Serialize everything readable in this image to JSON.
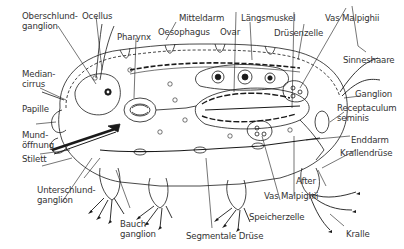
{
  "diagram": {
    "language": "German",
    "colors": {
      "line": "#1a1a1a",
      "text": "#333333",
      "background": "#ffffff"
    },
    "labels": {
      "oberschlundganglion": "Oberschlund-\nganglion",
      "ocellus": "Ocellus",
      "pharynx": "Pharynx",
      "oesophagus": "Oesophagus",
      "mitteldarm": "Mitteldarm",
      "ovar": "Ovar",
      "laengsmuskel": "Längsmuskel",
      "druesenzelle": "Drüsenzelle",
      "vas_malpighii_top": "Vas Malpighii",
      "sinneshaare": "Sinneshaare",
      "mediancirrus": "Median-\ncirrus",
      "ganglion": "Ganglion",
      "papille": "Papille",
      "receptaculum": "Receptaculum\nseminis",
      "mundoeffnung": "Mund-\nöffnung",
      "enddarm": "Enddarm",
      "stilett": "Stilett",
      "munddruese": "Mund-\ndrüse",
      "krallendruese": "Krallendrüse",
      "unterschlundganglion": "Unterschlund-\nganglion",
      "after": "After",
      "vas_malpighii_bottom": "Vas Malpighii",
      "speicherzelle": "Speicherzelle",
      "bauchganglion": "Bauch-\nganglion",
      "segmentale_druese": "Segmentale Drüse",
      "kralle": "Kralle"
    }
  }
}
